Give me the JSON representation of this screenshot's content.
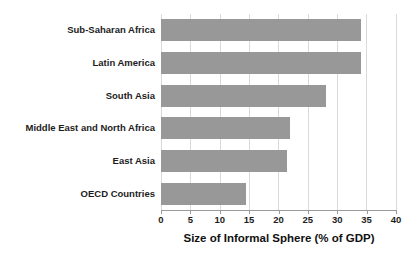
{
  "chart_data": {
    "type": "bar",
    "orientation": "horizontal",
    "title": "",
    "xlabel": "Size of Informal Sphere (% of GDP)",
    "ylabel": "",
    "xlim": [
      0,
      40
    ],
    "xticks": [
      0,
      5,
      10,
      15,
      20,
      25,
      30,
      35,
      40
    ],
    "grid": true,
    "legend": false,
    "bar_color": "#989898",
    "categories": [
      "Sub-Saharan Africa",
      "Latin America",
      "South Asia",
      "Middle East and North Africa",
      "East Asia",
      "OECD Countries"
    ],
    "values": [
      34,
      34,
      28,
      22,
      21.5,
      14.5
    ]
  },
  "axis": {
    "x_title": "Size of Informal Sphere (% of GDP)",
    "tick_labels": [
      "0",
      "5",
      "10",
      "15",
      "20",
      "25",
      "30",
      "35",
      "40"
    ]
  },
  "categories": [
    {
      "label": "Sub-Saharan Africa"
    },
    {
      "label": "Latin America"
    },
    {
      "label": "South Asia"
    },
    {
      "label": "Middle East and North Africa"
    },
    {
      "label": "East Asia"
    },
    {
      "label": "OECD Countries"
    }
  ]
}
